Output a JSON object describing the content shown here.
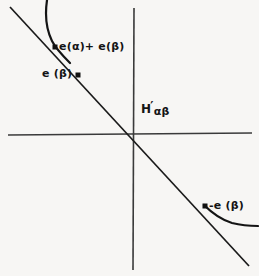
{
  "figure": {
    "background_color": "#f7f6f4",
    "stroke_color": "#1a1a1a",
    "width": 259,
    "height": 276
  },
  "axes": {
    "origin": {
      "x": 133,
      "y": 134
    },
    "horizontal": {
      "x1": 8,
      "y1": 135,
      "x2": 252,
      "y2": 133
    },
    "vertical": {
      "x1": 134,
      "y1": 8,
      "x2": 133,
      "y2": 270
    }
  },
  "line": {
    "name": "main-diagonal-line",
    "x1": 10,
    "y1": 7,
    "x2": 249,
    "y2": 266,
    "slope_sign": "negative"
  },
  "curves": [
    {
      "name": "upper-left-curve",
      "path": "M 47,0 C 45,14 46,29 52,41 C 55,47 61,54 70,63"
    },
    {
      "name": "lower-right-curve",
      "path": "M 204,205 C 213,214 222,220 232,223 C 240,225 248,226 256,226"
    }
  ],
  "points": [
    {
      "name": "point-e-alpha-plus-e-beta",
      "x": 55,
      "y": 47,
      "label": "e(α)+ e(β)"
    },
    {
      "name": "point-e-beta",
      "x": 78,
      "y": 75,
      "label": "e (β)"
    },
    {
      "name": "point-neg-e-beta",
      "x": 205,
      "y": 206,
      "label": "-e (β)"
    }
  ],
  "labels": {
    "sum_label": "e(α)+ e(β)",
    "e_beta_label": "e (β)",
    "neg_e_beta_label": "-e (β)",
    "hyperplane_main": "H",
    "hyperplane_prime": "′",
    "hyperplane_subscript": "αβ"
  }
}
